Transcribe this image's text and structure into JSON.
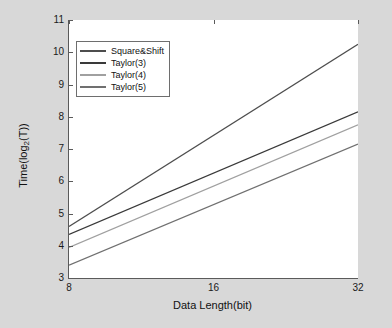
{
  "chart_data": {
    "type": "line",
    "title": "",
    "xlabel": "Data Length(bit)",
    "ylabel": "Time(log2(T))",
    "ylabel_parts": {
      "prefix": "Time(log",
      "sub": "2",
      "suffix": "(T))"
    },
    "x": [
      8,
      32
    ],
    "xtick_labels": [
      "8",
      "16",
      "32"
    ],
    "xticks": [
      8,
      16,
      32
    ],
    "xscale": "log2",
    "xlim": [
      8,
      32
    ],
    "ytick_labels": [
      "3",
      "4",
      "5",
      "6",
      "7",
      "8",
      "9",
      "10",
      "11"
    ],
    "yticks": [
      3,
      4,
      5,
      6,
      7,
      8,
      9,
      10,
      11
    ],
    "ylim": [
      3,
      11
    ],
    "grid": false,
    "legend_position": "upper-left",
    "series": [
      {
        "name": "Square&Shift",
        "values": [
          4.6,
          10.25
        ],
        "color": "#4d4d4d"
      },
      {
        "name": "Taylor(3)",
        "values": [
          4.35,
          8.15
        ],
        "color": "#3a3a3a"
      },
      {
        "name": "Taylor(4)",
        "values": [
          3.95,
          7.75
        ],
        "color": "#a0a0a0"
      },
      {
        "name": "Taylor(5)",
        "values": [
          3.4,
          7.15
        ],
        "color": "#707070"
      }
    ]
  },
  "colors": {
    "figure_background": "#d8d8d8",
    "axes_background": "#ffffff",
    "axis_line": "#5a5a5a",
    "text": "#111111"
  }
}
